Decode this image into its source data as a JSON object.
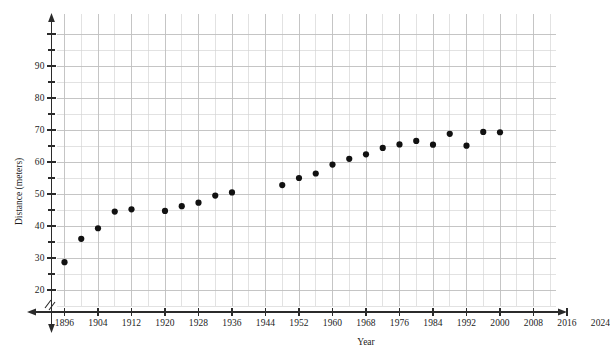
{
  "chart_data": {
    "type": "scatter",
    "title": "",
    "xlabel": "Year",
    "ylabel": "Distance (meters)",
    "xlim": [
      1892,
      2030
    ],
    "ylim": [
      15,
      99
    ],
    "grid": true,
    "legend": "none",
    "x_ticks": [
      1896,
      1904,
      1912,
      1920,
      1928,
      1936,
      1944,
      1952,
      1960,
      1968,
      1976,
      1984,
      1992,
      2000,
      2008,
      2016,
      2024
    ],
    "x_tick_labels": [
      "1896",
      "1904",
      "1912",
      "1920",
      "1928",
      "1936",
      "1944",
      "1952",
      "1960",
      "1968",
      "1976",
      "1984",
      "1992",
      "2000",
      "2008",
      "2016",
      "2024"
    ],
    "x_minor_step": 4,
    "y_ticks": [
      20,
      30,
      40,
      50,
      60,
      70,
      80,
      90
    ],
    "y_tick_labels": [
      "20",
      "30",
      "40",
      "50",
      "60",
      "70",
      "80",
      "90"
    ],
    "y_minor_step": 5,
    "x_axis_break": true,
    "marker": "filled-circle",
    "marker_color": "#111111",
    "marker_size": 3.1,
    "grid_color": "#bfbfbf",
    "axis_color": "#2b2b2b",
    "points": [
      {
        "x": 1896,
        "y": 28.7
      },
      {
        "x": 1900,
        "y": 36.0
      },
      {
        "x": 1904,
        "y": 39.3
      },
      {
        "x": 1908,
        "y": 44.5
      },
      {
        "x": 1912,
        "y": 45.2
      },
      {
        "x": 1920,
        "y": 44.7
      },
      {
        "x": 1924,
        "y": 46.2
      },
      {
        "x": 1928,
        "y": 47.3
      },
      {
        "x": 1932,
        "y": 49.5
      },
      {
        "x": 1936,
        "y": 50.5
      },
      {
        "x": 1948,
        "y": 52.8
      },
      {
        "x": 1952,
        "y": 55.0
      },
      {
        "x": 1956,
        "y": 56.4
      },
      {
        "x": 1960,
        "y": 59.2
      },
      {
        "x": 1964,
        "y": 61.0
      },
      {
        "x": 1968,
        "y": 62.4
      },
      {
        "x": 1972,
        "y": 64.4
      },
      {
        "x": 1976,
        "y": 65.5
      },
      {
        "x": 1980,
        "y": 66.6
      },
      {
        "x": 1984,
        "y": 65.4
      },
      {
        "x": 1988,
        "y": 68.8
      },
      {
        "x": 1992,
        "y": 65.1
      },
      {
        "x": 1996,
        "y": 69.4
      },
      {
        "x": 2000,
        "y": 69.3
      }
    ]
  },
  "axes": {
    "y_title": "Distance (meters)",
    "x_title": "Year"
  }
}
